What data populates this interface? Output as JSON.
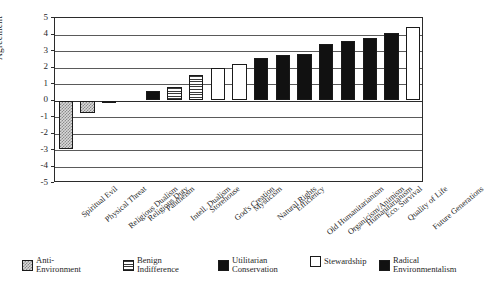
{
  "chart_data": {
    "type": "bar",
    "title": "",
    "xlabel": "",
    "ylabel": "Agreement",
    "ylim": [
      -5,
      5
    ],
    "yticks": [
      5,
      4,
      3,
      2,
      1,
      0,
      -1,
      -2,
      -3,
      -4,
      -5
    ],
    "ytick_labels": [
      "5",
      "4",
      "3",
      "2",
      "1",
      "0",
      "-1",
      "-2",
      "-3",
      "-4",
      "-5"
    ],
    "grid": true,
    "legend_position": "bottom",
    "categories": [
      "Spiritual Evil",
      "Physical Threat",
      "Religious Dualism",
      "Religious Duty",
      "Pantheism",
      "Intell. Dualism",
      "Storehouse",
      "God's Creation",
      "Mysticism",
      "Natural Rights",
      "Efficiency",
      "Old Humanitarianism",
      "Organicism/Animism",
      "Humanitarianism",
      "Eco. Survival",
      "Quality of Life",
      "Future Generations"
    ],
    "values": [
      -2.95,
      -0.75,
      -0.12,
      0.0,
      0.55,
      0.82,
      1.55,
      1.95,
      2.2,
      2.58,
      2.78,
      2.8,
      3.45,
      3.6,
      3.77,
      4.12,
      4.45
    ],
    "groups": [
      "anti-environment",
      "anti-environment",
      "benign-indifference",
      "benign-indifference",
      "utilitarian-conservation",
      "benign-indifference",
      "benign-indifference",
      "stewardship",
      "stewardship",
      "utilitarian-conservation",
      "utilitarian-conservation",
      "utilitarian-conservation",
      "radical-environmentalism",
      "radical-environmentalism",
      "radical-environmentalism",
      "radical-environmentalism",
      "stewardship"
    ],
    "legend": [
      {
        "key": "anti-environment",
        "label": "Anti-\nEnvironment",
        "swatch": "checkered-gray"
      },
      {
        "key": "benign-indifference",
        "label": "Benign\nIndifference",
        "swatch": "horizontal-lines"
      },
      {
        "key": "utilitarian-conservation",
        "label": "Utilitarian\nConservation",
        "swatch": "solid-black"
      },
      {
        "key": "stewardship",
        "label": "Stewardship",
        "swatch": "solid-white"
      },
      {
        "key": "radical-environmentalism",
        "label": "Radical\nEnvironmentalism",
        "swatch": "solid-black"
      }
    ]
  }
}
